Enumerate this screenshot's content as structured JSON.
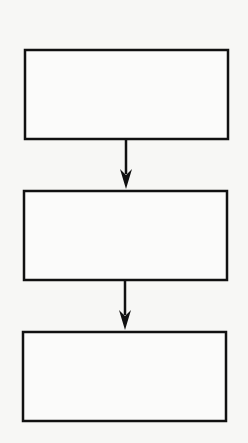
{
  "diagram": {
    "type": "flowchart",
    "direction": "top-to-bottom",
    "background": "#f7f7f5",
    "stroke_color": "#111111",
    "box_fill": "#fbfbfa",
    "nodes": [
      {
        "id": "box-1",
        "label": "",
        "x": 25,
        "y": 50,
        "width": 203,
        "height": 89
      },
      {
        "id": "box-2",
        "label": "",
        "x": 24,
        "y": 191,
        "width": 203,
        "height": 89
      },
      {
        "id": "box-3",
        "label": "",
        "x": 23,
        "y": 332,
        "width": 203,
        "height": 89
      }
    ],
    "edges": [
      {
        "from": "box-1",
        "to": "box-2",
        "x": 126,
        "y1": 139,
        "y2": 190
      },
      {
        "from": "box-2",
        "to": "box-3",
        "x": 125,
        "y1": 280,
        "y2": 331
      }
    ]
  }
}
